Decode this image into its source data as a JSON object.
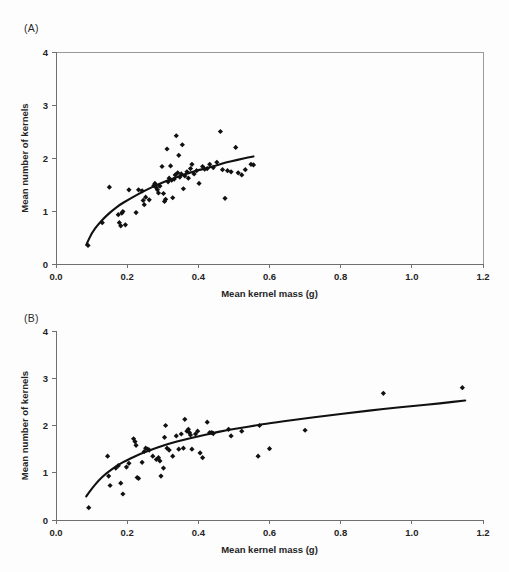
{
  "figure": {
    "background": "#fdfdfd",
    "marker_color": "#111111",
    "curve_color": "#111111",
    "axis_color": "#6f6f6f"
  },
  "panel_a": {
    "tag": "(A)",
    "xlabel": "Mean kernel mass (g)",
    "ylabel": "Mean number of kernels",
    "xticks": [
      "0.0",
      "0.2",
      "0.4",
      "0.6",
      "0.8",
      "1.0",
      "1.2"
    ],
    "yticks": [
      "0",
      "1",
      "2",
      "3",
      "4"
    ]
  },
  "panel_b": {
    "tag": "(B)",
    "xlabel": "Mean kernel mass (g)",
    "ylabel": "Mean number of kernels",
    "xticks": [
      "0.0",
      "0.2",
      "0.4",
      "0.6",
      "0.8",
      "1.0",
      "1.2"
    ],
    "yticks": [
      "0",
      "1",
      "2",
      "3",
      "4"
    ]
  },
  "chart_data": [
    {
      "type": "scatter",
      "panel": "(A)",
      "title": "",
      "xlabel": "Mean kernel mass (g)",
      "ylabel": "Mean number of kernels",
      "xlim": [
        0.0,
        1.2
      ],
      "ylim": [
        0,
        4
      ],
      "xticks": [
        0.0,
        0.2,
        0.4,
        0.6,
        0.8,
        1.0,
        1.2
      ],
      "yticks": [
        0,
        1,
        2,
        3,
        4
      ],
      "grid": false,
      "legend": null,
      "frame": "box",
      "points": [
        [
          0.09,
          0.35
        ],
        [
          0.13,
          0.78
        ],
        [
          0.15,
          1.45
        ],
        [
          0.175,
          0.93
        ],
        [
          0.178,
          0.78
        ],
        [
          0.182,
          0.72
        ],
        [
          0.185,
          0.96
        ],
        [
          0.188,
          0.99
        ],
        [
          0.195,
          0.74
        ],
        [
          0.205,
          1.4
        ],
        [
          0.225,
          0.97
        ],
        [
          0.232,
          1.4
        ],
        [
          0.242,
          1.38
        ],
        [
          0.245,
          1.2
        ],
        [
          0.248,
          1.12
        ],
        [
          0.252,
          1.26
        ],
        [
          0.262,
          1.21
        ],
        [
          0.275,
          1.48
        ],
        [
          0.278,
          1.52
        ],
        [
          0.282,
          1.44
        ],
        [
          0.285,
          1.4
        ],
        [
          0.288,
          1.34
        ],
        [
          0.292,
          1.47
        ],
        [
          0.298,
          1.84
        ],
        [
          0.302,
          1.33
        ],
        [
          0.305,
          1.18
        ],
        [
          0.308,
          1.22
        ],
        [
          0.312,
          2.17
        ],
        [
          0.315,
          1.55
        ],
        [
          0.318,
          1.62
        ],
        [
          0.322,
          1.85
        ],
        [
          0.325,
          1.58
        ],
        [
          0.328,
          1.25
        ],
        [
          0.332,
          1.6
        ],
        [
          0.335,
          1.68
        ],
        [
          0.338,
          2.42
        ],
        [
          0.342,
          1.72
        ],
        [
          0.345,
          2.05
        ],
        [
          0.348,
          1.64
        ],
        [
          0.352,
          1.7
        ],
        [
          0.355,
          2.25
        ],
        [
          0.358,
          1.42
        ],
        [
          0.362,
          1.66
        ],
        [
          0.368,
          1.74
        ],
        [
          0.372,
          1.62
        ],
        [
          0.378,
          1.8
        ],
        [
          0.382,
          1.88
        ],
        [
          0.388,
          1.7
        ],
        [
          0.395,
          1.76
        ],
        [
          0.402,
          1.52
        ],
        [
          0.412,
          1.84
        ],
        [
          0.418,
          1.79
        ],
        [
          0.425,
          1.8
        ],
        [
          0.432,
          1.88
        ],
        [
          0.442,
          1.82
        ],
        [
          0.452,
          1.92
        ],
        [
          0.462,
          2.5
        ],
        [
          0.468,
          1.78
        ],
        [
          0.475,
          1.24
        ],
        [
          0.482,
          1.76
        ],
        [
          0.492,
          1.74
        ],
        [
          0.505,
          2.2
        ],
        [
          0.512,
          1.72
        ],
        [
          0.522,
          1.68
        ],
        [
          0.532,
          1.78
        ],
        [
          0.548,
          1.88
        ],
        [
          0.555,
          1.87
        ]
      ],
      "fit_curve": {
        "description": "saturating fitted curve",
        "points": [
          [
            0.085,
            0.36
          ],
          [
            0.1,
            0.58
          ],
          [
            0.12,
            0.76
          ],
          [
            0.14,
            0.9
          ],
          [
            0.16,
            1.02
          ],
          [
            0.18,
            1.12
          ],
          [
            0.2,
            1.2
          ],
          [
            0.22,
            1.28
          ],
          [
            0.24,
            1.35
          ],
          [
            0.26,
            1.42
          ],
          [
            0.28,
            1.48
          ],
          [
            0.3,
            1.54
          ],
          [
            0.32,
            1.59
          ],
          [
            0.34,
            1.64
          ],
          [
            0.36,
            1.69
          ],
          [
            0.38,
            1.73
          ],
          [
            0.4,
            1.77
          ],
          [
            0.42,
            1.8
          ],
          [
            0.44,
            1.84
          ],
          [
            0.46,
            1.88
          ],
          [
            0.48,
            1.92
          ],
          [
            0.5,
            1.95
          ],
          [
            0.52,
            1.98
          ],
          [
            0.54,
            2.01
          ],
          [
            0.555,
            2.03
          ]
        ]
      }
    },
    {
      "type": "scatter",
      "panel": "(B)",
      "title": "",
      "xlabel": "Mean kernel mass (g)",
      "ylabel": "Mean number of kernels",
      "xlim": [
        0.0,
        1.2
      ],
      "ylim": [
        0,
        4
      ],
      "xticks": [
        0.0,
        0.2,
        0.4,
        0.6,
        0.8,
        1.0,
        1.2
      ],
      "yticks": [
        0,
        1,
        2,
        3,
        4
      ],
      "grid": false,
      "legend": null,
      "frame": "axes-only",
      "points": [
        [
          0.092,
          0.26
        ],
        [
          0.145,
          1.35
        ],
        [
          0.148,
          0.93
        ],
        [
          0.152,
          0.73
        ],
        [
          0.168,
          1.1
        ],
        [
          0.175,
          1.15
        ],
        [
          0.182,
          0.78
        ],
        [
          0.188,
          0.55
        ],
        [
          0.198,
          1.12
        ],
        [
          0.205,
          1.2
        ],
        [
          0.218,
          1.72
        ],
        [
          0.222,
          1.66
        ],
        [
          0.225,
          1.58
        ],
        [
          0.228,
          0.9
        ],
        [
          0.232,
          0.88
        ],
        [
          0.242,
          1.22
        ],
        [
          0.248,
          1.45
        ],
        [
          0.252,
          1.52
        ],
        [
          0.258,
          1.5
        ],
        [
          0.262,
          1.48
        ],
        [
          0.272,
          1.35
        ],
        [
          0.282,
          1.28
        ],
        [
          0.288,
          1.32
        ],
        [
          0.292,
          1.25
        ],
        [
          0.295,
          0.93
        ],
        [
          0.302,
          1.1
        ],
        [
          0.305,
          1.75
        ],
        [
          0.308,
          2.0
        ],
        [
          0.312,
          1.52
        ],
        [
          0.318,
          1.48
        ],
        [
          0.328,
          1.35
        ],
        [
          0.338,
          1.78
        ],
        [
          0.345,
          1.5
        ],
        [
          0.352,
          1.82
        ],
        [
          0.358,
          1.52
        ],
        [
          0.362,
          2.13
        ],
        [
          0.368,
          1.88
        ],
        [
          0.372,
          1.92
        ],
        [
          0.375,
          1.85
        ],
        [
          0.378,
          1.8
        ],
        [
          0.382,
          1.5
        ],
        [
          0.392,
          1.82
        ],
        [
          0.398,
          1.88
        ],
        [
          0.405,
          1.42
        ],
        [
          0.412,
          1.32
        ],
        [
          0.425,
          2.07
        ],
        [
          0.432,
          1.85
        ],
        [
          0.438,
          1.85
        ],
        [
          0.442,
          1.83
        ],
        [
          0.485,
          1.92
        ],
        [
          0.492,
          1.78
        ],
        [
          0.522,
          1.88
        ],
        [
          0.568,
          1.35
        ],
        [
          0.572,
          2.0
        ],
        [
          0.6,
          1.51
        ],
        [
          0.7,
          1.9
        ],
        [
          0.92,
          2.68
        ],
        [
          1.142,
          2.8
        ]
      ],
      "fit_curve": {
        "description": "saturating fitted curve",
        "points": [
          [
            0.085,
            0.5
          ],
          [
            0.1,
            0.66
          ],
          [
            0.12,
            0.84
          ],
          [
            0.14,
            0.98
          ],
          [
            0.16,
            1.09
          ],
          [
            0.18,
            1.19
          ],
          [
            0.2,
            1.27
          ],
          [
            0.24,
            1.41
          ],
          [
            0.28,
            1.52
          ],
          [
            0.32,
            1.62
          ],
          [
            0.36,
            1.7
          ],
          [
            0.4,
            1.77
          ],
          [
            0.44,
            1.84
          ],
          [
            0.48,
            1.9
          ],
          [
            0.52,
            1.95
          ],
          [
            0.56,
            2.0
          ],
          [
            0.6,
            2.05
          ],
          [
            0.68,
            2.13
          ],
          [
            0.76,
            2.21
          ],
          [
            0.84,
            2.28
          ],
          [
            0.92,
            2.35
          ],
          [
            1.0,
            2.41
          ],
          [
            1.08,
            2.47
          ],
          [
            1.15,
            2.53
          ]
        ]
      }
    }
  ]
}
